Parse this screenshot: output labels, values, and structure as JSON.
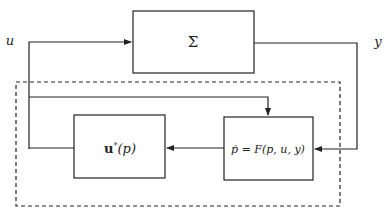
{
  "diagram": {
    "type": "block-diagram",
    "signals": {
      "input": "u",
      "output": "y"
    },
    "blocks": {
      "plant": {
        "label": "Σ"
      },
      "controller": {
        "label_bold": "u",
        "label_sup": "*",
        "label_rest": "(p)"
      },
      "estimator": {
        "label": "ṗ = F(p, u, y)"
      }
    },
    "groups": {
      "adaptive_controller": {
        "style": "dashed"
      }
    },
    "connections": [
      {
        "from": "u",
        "to": "plant"
      },
      {
        "from": "plant",
        "to": "estimator",
        "signal": "y"
      },
      {
        "from": "u",
        "to": "estimator"
      },
      {
        "from": "estimator",
        "to": "controller"
      },
      {
        "from": "controller",
        "to": "u"
      }
    ],
    "colors": {
      "stroke": "#222222",
      "background": "#ffffff"
    }
  }
}
